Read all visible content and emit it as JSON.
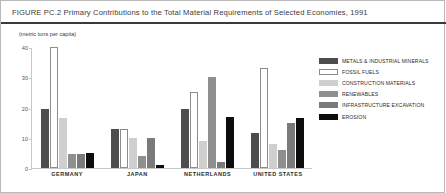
{
  "figure": {
    "title": "FIGURE PC.2   Primary Contributions to the Total Material Requirements of Selected Economies, 1991",
    "subtitle": "(metric tons per capita)"
  },
  "chart_data": {
    "type": "bar",
    "title": "FIGURE PC.2   Primary Contributions to the Total Material Requirements of Selected Economies, 1991",
    "subtitle": "(metric tons per capita)",
    "xlabel": "",
    "ylabel": "",
    "ylim": [
      0,
      40
    ],
    "yticks": [
      0,
      10,
      20,
      30,
      40
    ],
    "ytick_labels": [
      "0",
      "10",
      "20",
      "30",
      "40"
    ],
    "grid": false,
    "legend_position": "right",
    "categories": [
      "GERMANY",
      "JAPAN",
      "NETHERLANDS",
      "UNITED STATES"
    ],
    "series": [
      {
        "name": "METALS & INDUSTRIAL MINERALS",
        "color": "#4d4d4d",
        "values": [
          19.5,
          13.0,
          19.5,
          11.5
        ]
      },
      {
        "name": "FOSSIL FUELS",
        "color": "#ffffff",
        "values": [
          40.0,
          13.0,
          25.0,
          33.0
        ]
      },
      {
        "name": "CONSTRUCTION MATERIALS",
        "color": "#cfcfcf",
        "values": [
          16.5,
          10.0,
          9.0,
          8.0
        ]
      },
      {
        "name": "RENEWABLES",
        "color": "#8f8f8f",
        "values": [
          4.5,
          4.0,
          30.0,
          6.0
        ]
      },
      {
        "name": "INFRASTRUCTURE EXCAVATION",
        "color": "#7a7a7a",
        "values": [
          4.5,
          10.0,
          2.0,
          15.0
        ]
      },
      {
        "name": "EROSION",
        "color": "#0d0d0d",
        "values": [
          5.0,
          1.0,
          17.0,
          16.5
        ]
      }
    ]
  }
}
